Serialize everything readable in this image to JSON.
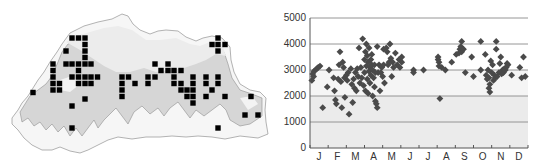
{
  "map_panel": {
    "description": "Distribution map with occurrence grid squares",
    "colors": {
      "outline": "#9a9a9a",
      "elevation_band": "#d4d4d4",
      "highland": "#f2f2f2",
      "square": "#000000"
    },
    "squares": [
      [
        72,
        38
      ],
      [
        78.5,
        38
      ],
      [
        85,
        38
      ],
      [
        85,
        44.5
      ],
      [
        66,
        51
      ],
      [
        85,
        51
      ],
      [
        85,
        57.5
      ],
      [
        53,
        64
      ],
      [
        66,
        64
      ],
      [
        72,
        64
      ],
      [
        78.5,
        64
      ],
      [
        85,
        64
      ],
      [
        91,
        64
      ],
      [
        53,
        70.5
      ],
      [
        78.5,
        70.5
      ],
      [
        53,
        77
      ],
      [
        72,
        77
      ],
      [
        78.5,
        77
      ],
      [
        85,
        77
      ],
      [
        91,
        77
      ],
      [
        97.5,
        77
      ],
      [
        53,
        83.5
      ],
      [
        59.5,
        83.5
      ],
      [
        78.5,
        83.5
      ],
      [
        85,
        83.5
      ],
      [
        91,
        83.5
      ],
      [
        53,
        90
      ],
      [
        59.5,
        90
      ],
      [
        33,
        92.5
      ],
      [
        85,
        99
      ],
      [
        72,
        106
      ],
      [
        72,
        128
      ],
      [
        155,
        64
      ],
      [
        168,
        64
      ],
      [
        161,
        70.5
      ],
      [
        168,
        70.5
      ],
      [
        174,
        70.5
      ],
      [
        181,
        70.5
      ],
      [
        122,
        77
      ],
      [
        128.5,
        77
      ],
      [
        148,
        77
      ],
      [
        155,
        77
      ],
      [
        174,
        77
      ],
      [
        193,
        77
      ],
      [
        122,
        83.5
      ],
      [
        135,
        83.5
      ],
      [
        148,
        83.5
      ],
      [
        174,
        83.5
      ],
      [
        181,
        83.5
      ],
      [
        193,
        83.5
      ],
      [
        122,
        90
      ],
      [
        181,
        90
      ],
      [
        187,
        90
      ],
      [
        193,
        90
      ],
      [
        122,
        96.5
      ],
      [
        187,
        96.5
      ],
      [
        193,
        96.5
      ],
      [
        193,
        103
      ],
      [
        206,
        77
      ],
      [
        218,
        77
      ],
      [
        206,
        83.5
      ],
      [
        218,
        83.5
      ],
      [
        212,
        90
      ],
      [
        206,
        96.5
      ],
      [
        225,
        96.5
      ],
      [
        218,
        38
      ],
      [
        212,
        44.5
      ],
      [
        218,
        44.5
      ],
      [
        225,
        44.5
      ],
      [
        218,
        51
      ],
      [
        251,
        96.5
      ],
      [
        245,
        115
      ],
      [
        258,
        115
      ],
      [
        218,
        128
      ]
    ]
  },
  "chart_data": {
    "type": "scatter",
    "title": "",
    "xlabel": "",
    "ylabel": "",
    "x_tick_labels": [
      "J",
      "F",
      "M",
      "A",
      "M",
      "J",
      "J",
      "A",
      "S",
      "O",
      "N",
      "D"
    ],
    "y_tick_labels": [
      "0",
      "1000",
      "2000",
      "3000",
      "4000",
      "5000"
    ],
    "ylim": [
      0,
      5000
    ],
    "xlim": [
      0,
      12
    ],
    "grid": "horizontal at 1000 intervals",
    "background_bands": {
      "0-2000": "#ebebeb",
      "2000-3000": "#f5f5f5",
      "3000-5000": "#ffffff"
    },
    "marker": "diamond",
    "marker_color": "#4a4a4a",
    "points": [
      [
        0.1,
        2600
      ],
      [
        0.15,
        2850
      ],
      [
        0.22,
        2950
      ],
      [
        0.3,
        3000
      ],
      [
        0.38,
        3050
      ],
      [
        0.45,
        3100
      ],
      [
        0.55,
        3150
      ],
      [
        0.2,
        2750
      ],
      [
        0.7,
        1550
      ],
      [
        0.95,
        2350
      ],
      [
        1.05,
        3000
      ],
      [
        1.3,
        2700
      ],
      [
        1.35,
        2200
      ],
      [
        1.4,
        1850
      ],
      [
        1.45,
        1700
      ],
      [
        1.55,
        2650
      ],
      [
        1.6,
        3200
      ],
      [
        1.65,
        3700
      ],
      [
        1.7,
        2550
      ],
      [
        1.75,
        1550
      ],
      [
        1.8,
        3300
      ],
      [
        1.85,
        3100
      ],
      [
        1.9,
        2700
      ],
      [
        1.92,
        1950
      ],
      [
        2.0,
        2800
      ],
      [
        2.05,
        2600
      ],
      [
        2.1,
        2900
      ],
      [
        2.15,
        1300
      ],
      [
        2.25,
        3050
      ],
      [
        2.3,
        2450
      ],
      [
        2.35,
        1750
      ],
      [
        2.4,
        2650
      ],
      [
        2.45,
        2300
      ],
      [
        2.5,
        2900
      ],
      [
        2.55,
        2200
      ],
      [
        2.6,
        3050
      ],
      [
        2.65,
        2750
      ],
      [
        2.7,
        3850
      ],
      [
        2.75,
        2500
      ],
      [
        2.8,
        3100
      ],
      [
        2.85,
        2700
      ],
      [
        2.9,
        4200
      ],
      [
        2.95,
        2400
      ],
      [
        3.0,
        3400
      ],
      [
        3.0,
        2900
      ],
      [
        3.05,
        3700
      ],
      [
        3.05,
        2200
      ],
      [
        3.1,
        4000
      ],
      [
        3.1,
        3150
      ],
      [
        3.15,
        2650
      ],
      [
        3.15,
        3550
      ],
      [
        3.2,
        2100
      ],
      [
        3.2,
        3300
      ],
      [
        3.25,
        2950
      ],
      [
        3.25,
        3850
      ],
      [
        3.3,
        3100
      ],
      [
        3.3,
        2500
      ],
      [
        3.35,
        3400
      ],
      [
        3.35,
        2800
      ],
      [
        3.4,
        3200
      ],
      [
        3.4,
        3600
      ],
      [
        3.45,
        2000
      ],
      [
        3.45,
        3000
      ],
      [
        3.5,
        2700
      ],
      [
        3.55,
        2350
      ],
      [
        3.55,
        3200
      ],
      [
        3.6,
        1800
      ],
      [
        3.6,
        2900
      ],
      [
        3.65,
        1700
      ],
      [
        3.7,
        1550
      ],
      [
        3.7,
        3900
      ],
      [
        3.75,
        2900
      ],
      [
        3.8,
        3200
      ],
      [
        3.85,
        2200
      ],
      [
        3.9,
        2900
      ],
      [
        3.95,
        3100
      ],
      [
        4.0,
        2750
      ],
      [
        4.05,
        3200
      ],
      [
        4.05,
        3800
      ],
      [
        4.1,
        2500
      ],
      [
        4.2,
        3850
      ],
      [
        4.25,
        3700
      ],
      [
        4.3,
        3200
      ],
      [
        4.35,
        3300
      ],
      [
        4.4,
        4000
      ],
      [
        4.45,
        3450
      ],
      [
        4.5,
        2750
      ],
      [
        4.55,
        3300
      ],
      [
        4.6,
        3100
      ],
      [
        4.7,
        3650
      ],
      [
        4.8,
        3200
      ],
      [
        4.9,
        3400
      ],
      [
        4.95,
        3100
      ],
      [
        5.05,
        3500
      ],
      [
        5.05,
        3300
      ],
      [
        5.7,
        3000
      ],
      [
        5.7,
        2900
      ],
      [
        6.25,
        3000
      ],
      [
        7.05,
        3500
      ],
      [
        7.05,
        3400
      ],
      [
        7.1,
        3300
      ],
      [
        7.1,
        3150
      ],
      [
        7.15,
        1900
      ],
      [
        7.25,
        3100
      ],
      [
        7.45,
        3000
      ],
      [
        7.8,
        3300
      ],
      [
        8.05,
        3600
      ],
      [
        8.2,
        3650
      ],
      [
        8.25,
        3800
      ],
      [
        8.3,
        3900
      ],
      [
        8.35,
        3700
      ],
      [
        8.35,
        4100
      ],
      [
        8.45,
        3800
      ],
      [
        8.55,
        2900
      ],
      [
        8.9,
        3500
      ],
      [
        9.0,
        2750
      ],
      [
        9.4,
        4100
      ],
      [
        9.4,
        3000
      ],
      [
        9.65,
        3600
      ],
      [
        9.7,
        2800
      ],
      [
        9.75,
        2650
      ],
      [
        9.8,
        3000
      ],
      [
        9.85,
        2700
      ],
      [
        9.85,
        2300
      ],
      [
        9.9,
        2150
      ],
      [
        9.9,
        2450
      ],
      [
        9.95,
        3350
      ],
      [
        10.0,
        2900
      ],
      [
        10.05,
        3200
      ],
      [
        10.1,
        2600
      ],
      [
        10.15,
        2800
      ],
      [
        10.2,
        2700
      ],
      [
        10.25,
        4100
      ],
      [
        10.25,
        3800
      ],
      [
        10.3,
        2750
      ],
      [
        10.4,
        2900
      ],
      [
        10.45,
        3250
      ],
      [
        10.5,
        3500
      ],
      [
        10.55,
        2850
      ],
      [
        10.6,
        3000
      ],
      [
        10.65,
        2900
      ],
      [
        10.7,
        3050
      ],
      [
        10.75,
        3000
      ],
      [
        10.8,
        3100
      ],
      [
        10.85,
        3250
      ],
      [
        10.9,
        3200
      ],
      [
        11.1,
        2800
      ],
      [
        11.55,
        3100
      ],
      [
        11.65,
        2700
      ],
      [
        11.75,
        3500
      ],
      [
        11.85,
        2750
      ]
    ]
  }
}
